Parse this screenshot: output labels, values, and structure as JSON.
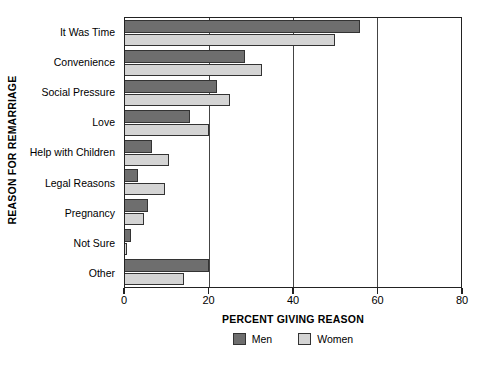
{
  "chart_data": {
    "type": "bar",
    "orientation": "horizontal",
    "title": "",
    "xlabel": "PERCENT GIVING REASON",
    "ylabel": "REASON FOR REMARRIAGE",
    "xlim": [
      0,
      80
    ],
    "xticks": [
      0,
      20,
      40,
      60,
      80
    ],
    "xtick_labels": [
      "0",
      "20",
      "40",
      "60",
      "80"
    ],
    "grid": "vertical",
    "legend_position": "bottom",
    "categories": [
      "It Was Time",
      "Convenience",
      "Social Pressure",
      "Love",
      "Help with Children",
      "Legal Reasons",
      "Pregnancy",
      "Not Sure",
      "Other"
    ],
    "series": [
      {
        "name": "Men",
        "color": "#6e6e6e",
        "values": [
          56,
          28.5,
          22,
          15.5,
          6.5,
          3,
          5.5,
          1.5,
          20
        ]
      },
      {
        "name": "Women",
        "color": "#d4d4d4",
        "values": [
          50,
          32.5,
          25,
          20,
          10.5,
          9.5,
          4.5,
          0.5,
          14
        ]
      }
    ]
  },
  "legend": {
    "items": [
      {
        "label": "Men",
        "color": "#6e6e6e"
      },
      {
        "label": "Women",
        "color": "#d4d4d4"
      }
    ]
  }
}
